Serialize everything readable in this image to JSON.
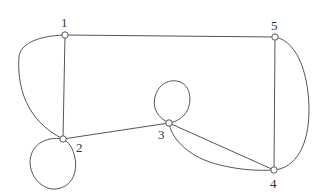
{
  "graph": {
    "nodes": [
      {
        "id": "1",
        "label": "1",
        "x": 65,
        "y": 35
      },
      {
        "id": "2",
        "label": "2",
        "x": 63,
        "y": 139
      },
      {
        "id": "3",
        "label": "3",
        "x": 169,
        "y": 123
      },
      {
        "id": "4",
        "label": "4",
        "x": 274,
        "y": 170
      },
      {
        "id": "5",
        "label": "5",
        "x": 275,
        "y": 37
      }
    ],
    "edges": [
      {
        "from": "1",
        "to": "5",
        "type": "straight"
      },
      {
        "from": "1",
        "to": "2",
        "type": "straight"
      },
      {
        "from": "1",
        "to": "2",
        "type": "curved"
      },
      {
        "from": "2",
        "to": "2",
        "type": "loop"
      },
      {
        "from": "2",
        "to": "3",
        "type": "straight"
      },
      {
        "from": "3",
        "to": "3",
        "type": "loop"
      },
      {
        "from": "3",
        "to": "4",
        "type": "straight"
      },
      {
        "from": "3",
        "to": "4",
        "type": "curved"
      },
      {
        "from": "5",
        "to": "4",
        "type": "straight"
      },
      {
        "from": "5",
        "to": "4",
        "type": "curved"
      }
    ]
  }
}
